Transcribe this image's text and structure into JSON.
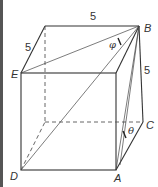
{
  "diagram": {
    "type": "cube",
    "vertices": {
      "top_back_left": {
        "x": 45,
        "y": 26
      },
      "B": {
        "x": 139,
        "y": 26
      },
      "E": {
        "x": 21,
        "y": 73
      },
      "top_front_right": {
        "x": 116,
        "y": 73
      },
      "bottom_back_left": {
        "x": 45,
        "y": 122
      },
      "C": {
        "x": 143,
        "y": 122
      },
      "D": {
        "x": 21,
        "y": 170
      },
      "A": {
        "x": 116,
        "y": 170
      }
    },
    "labels": {
      "B": "B",
      "E": "E",
      "C": "C",
      "D": "D",
      "A": "A"
    },
    "edge_lengths": {
      "top": "5",
      "left_depth": "5",
      "right_vertical": "5"
    },
    "angles": {
      "phi": "φ",
      "theta": "θ"
    },
    "colors": {
      "line": "#333333",
      "border": "#555555",
      "background": "#ffffff"
    }
  }
}
